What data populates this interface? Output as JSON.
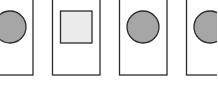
{
  "diagram": {
    "colors": {
      "stroke": "#2b2b2b",
      "circle_fill": "#a6a6a6",
      "square_fill": "#ececec",
      "card_fill": "#ffffff"
    },
    "cards": [
      {
        "shape": "circle",
        "label": ""
      },
      {
        "shape": "square",
        "label": ""
      },
      {
        "shape": "circle",
        "label": ""
      },
      {
        "shape": "circle",
        "label": ""
      }
    ]
  }
}
